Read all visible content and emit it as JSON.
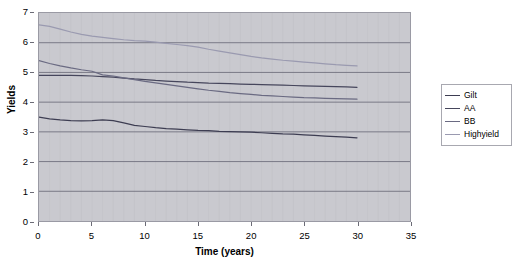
{
  "chart_data": {
    "type": "line",
    "title": "",
    "xlabel": "Time (years)",
    "ylabel": "Yields",
    "xlim": [
      0,
      35
    ],
    "ylim": [
      0,
      7
    ],
    "xticks": [
      0,
      5,
      10,
      15,
      20,
      25,
      30,
      35
    ],
    "yticks": [
      0,
      1,
      2,
      3,
      4,
      5,
      6,
      7
    ],
    "grid": "horizontal-major-and-faint-vertical",
    "legend_position": "right",
    "plot_background": "#c9c9cf",
    "x": [
      0,
      1,
      2,
      3,
      4,
      5,
      6,
      7,
      8,
      9,
      10,
      11,
      12,
      13,
      14,
      15,
      16,
      17,
      18,
      19,
      20,
      21,
      22,
      23,
      24,
      25,
      26,
      27,
      28,
      29,
      30
    ],
    "series": [
      {
        "name": "Gilt",
        "color": "#3d3d52",
        "values": [
          3.5,
          3.44,
          3.4,
          3.38,
          3.37,
          3.38,
          3.4,
          3.38,
          3.3,
          3.22,
          3.18,
          3.14,
          3.11,
          3.09,
          3.07,
          3.05,
          3.04,
          3.02,
          3.01,
          3.0,
          2.99,
          2.97,
          2.95,
          2.93,
          2.92,
          2.9,
          2.88,
          2.86,
          2.84,
          2.82,
          2.8
        ]
      },
      {
        "name": "AA",
        "color": "#46465c",
        "values": [
          4.9,
          4.9,
          4.9,
          4.9,
          4.89,
          4.88,
          4.86,
          4.84,
          4.81,
          4.78,
          4.76,
          4.73,
          4.71,
          4.69,
          4.67,
          4.66,
          4.64,
          4.63,
          4.62,
          4.61,
          4.6,
          4.59,
          4.58,
          4.57,
          4.56,
          4.55,
          4.54,
          4.53,
          4.52,
          4.51,
          4.5
        ]
      },
      {
        "name": "BB",
        "color": "#6a6a82",
        "values": [
          5.4,
          5.3,
          5.22,
          5.15,
          5.09,
          5.04,
          4.92,
          4.88,
          4.82,
          4.76,
          4.7,
          4.65,
          4.6,
          4.55,
          4.5,
          4.45,
          4.4,
          4.36,
          4.32,
          4.29,
          4.26,
          4.23,
          4.21,
          4.19,
          4.17,
          4.15,
          4.14,
          4.13,
          4.12,
          4.11,
          4.1
        ]
      },
      {
        "name": "Highyield",
        "color": "#9a9ab0",
        "values": [
          6.6,
          6.55,
          6.46,
          6.36,
          6.28,
          6.22,
          6.18,
          6.14,
          6.1,
          6.07,
          6.05,
          6.02,
          5.98,
          5.94,
          5.9,
          5.85,
          5.78,
          5.72,
          5.66,
          5.6,
          5.54,
          5.49,
          5.45,
          5.41,
          5.38,
          5.35,
          5.32,
          5.29,
          5.26,
          5.24,
          5.22
        ]
      }
    ]
  },
  "legend": {
    "items": [
      {
        "label": "Gilt"
      },
      {
        "label": "AA"
      },
      {
        "label": "BB"
      },
      {
        "label": "Highyield"
      }
    ]
  },
  "axes": {
    "y_title": "Yields",
    "x_title": "Time (years)",
    "y_tick_labels": [
      "7",
      "6",
      "5",
      "4",
      "3",
      "2",
      "1",
      "0"
    ],
    "x_tick_labels": [
      "0",
      "5",
      "10",
      "15",
      "20",
      "25",
      "30",
      "35"
    ]
  }
}
